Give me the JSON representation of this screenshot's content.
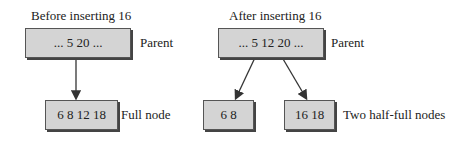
{
  "before": {
    "title": "Before inserting 16",
    "parent": "... 5 20 ...",
    "parent_label": "Parent",
    "child": "6 8 12 18",
    "child_label": "Full node"
  },
  "after": {
    "title": "After inserting 16",
    "parent": "... 5 12 20 ...",
    "parent_label": "Parent",
    "left_child": "6 8",
    "right_child": "16 18",
    "children_label": "Two half-full nodes"
  },
  "colors": {
    "node_fill": "#d4d4d4",
    "border": "#555555",
    "arrow": "#333333"
  }
}
